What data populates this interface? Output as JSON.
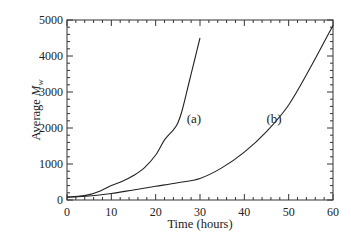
{
  "chart_data": {
    "type": "line",
    "title": "",
    "xlabel": "Time (hours)",
    "ylabel_prefix": "Average ",
    "ylabel_var": "M",
    "ylabel_sub": "w",
    "xlim": [
      0,
      60
    ],
    "ylim": [
      0,
      5000
    ],
    "xticks": [
      0,
      10,
      20,
      30,
      40,
      50,
      60
    ],
    "yticks": [
      0,
      1000,
      2000,
      3000,
      4000,
      5000
    ],
    "x_minor_step": 2,
    "y_minor_step": 200,
    "grid": false,
    "legend": "none",
    "series": [
      {
        "name": "(a)",
        "x": [
          0,
          2.5,
          5,
          7.5,
          10,
          12.5,
          15,
          17.5,
          20,
          22,
          24,
          25,
          26,
          27.5,
          29,
          30
        ],
        "values": [
          80,
          100,
          150,
          250,
          400,
          520,
          680,
          900,
          1250,
          1670,
          1950,
          2140,
          2500,
          3250,
          4000,
          4500
        ],
        "label_pos": {
          "x": 27.0,
          "y": 2150
        }
      },
      {
        "name": "(b)",
        "x": [
          0,
          5,
          10,
          15,
          20,
          25,
          30,
          35,
          40,
          45,
          50,
          55,
          60
        ],
        "values": [
          80,
          110,
          180,
          280,
          380,
          480,
          600,
          900,
          1330,
          1900,
          2640,
          3700,
          4850
        ],
        "label_pos": {
          "x": 45.0,
          "y": 2150
        }
      }
    ]
  },
  "axes": {
    "x_title": "Time (hours)",
    "y_title_prefix": "Average ",
    "y_title_var": "M",
    "y_title_sub": "w"
  },
  "labels": {
    "a": "(a)",
    "b": "(b)"
  },
  "colors": {
    "line": "#222222",
    "axis": "#333333",
    "background": "#ffffff"
  }
}
